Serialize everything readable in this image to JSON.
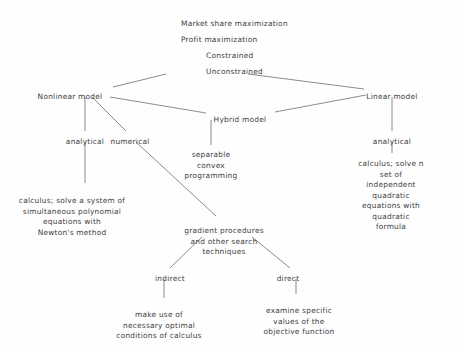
{
  "diagram": {
    "type": "hierarchy-tree",
    "background_color": "#fefefe",
    "text_color": "#3d3d3d",
    "line_color": "#6e6e6e",
    "nodes": [
      {
        "id": "market-share-maximization",
        "label": "Market share maximization",
        "x": 181,
        "y": 19,
        "align": "left"
      },
      {
        "id": "profit-maximization",
        "label": "Profit maximization",
        "x": 181,
        "y": 35,
        "align": "left"
      },
      {
        "id": "constrained",
        "label": "Constrained",
        "x": 206,
        "y": 51,
        "align": "left"
      },
      {
        "id": "unconstrained",
        "label": "Unconstrained",
        "x": 206,
        "y": 67,
        "align": "left"
      },
      {
        "id": "nonlinear-model",
        "label": "Nonlinear model",
        "x": 70,
        "y": 92,
        "align": "center"
      },
      {
        "id": "hybrid-model",
        "label": "Hybrid model",
        "x": 240,
        "y": 115,
        "align": "center"
      },
      {
        "id": "linear-model",
        "label": "Linear model",
        "x": 392,
        "y": 92,
        "align": "center"
      },
      {
        "id": "nonlinear-analytical",
        "label": "analytical",
        "x": 85,
        "y": 137,
        "align": "center"
      },
      {
        "id": "nonlinear-numerical",
        "label": "numerical",
        "x": 130,
        "y": 137,
        "align": "center"
      },
      {
        "id": "separable-convex-programming",
        "label": "separable\nconvex\nprogramming",
        "x": 211,
        "y": 150,
        "align": "center"
      },
      {
        "id": "linear-analytical",
        "label": "analytical",
        "x": 392,
        "y": 137,
        "align": "center"
      },
      {
        "id": "newton-method-leaf",
        "label": "calculus; solve a system of\nsimultaneous polynomial\nequations with\nNewton's method",
        "x": 72,
        "y": 196,
        "align": "center"
      },
      {
        "id": "quadratic-formula-leaf",
        "label": "calculus; solve n set of\nindependent quadratic\nequations with\nquadratic formula",
        "x": 391,
        "y": 159,
        "align": "center"
      },
      {
        "id": "gradient-procedures",
        "label": "gradient procedures\nand other search\ntechniques",
        "x": 224,
        "y": 226,
        "align": "center"
      },
      {
        "id": "indirect",
        "label": "indirect",
        "x": 170,
        "y": 274,
        "align": "center"
      },
      {
        "id": "direct",
        "label": "direct",
        "x": 288,
        "y": 274,
        "align": "center"
      },
      {
        "id": "necessary-optimal-conditions-leaf",
        "label": "make use of\nnecessary optimal\nconditions of calculus",
        "x": 159,
        "y": 310,
        "align": "center"
      },
      {
        "id": "objective-function-values-leaf",
        "label": "examine specific\nvalues of the\nobjective function",
        "x": 299,
        "y": 306,
        "align": "center"
      }
    ],
    "edges": [
      {
        "id": "unconstrained-to-nonlinear",
        "from": "unconstrained",
        "to": "nonlinear-model",
        "points": "166,74 113,87"
      },
      {
        "id": "unconstrained-to-linear",
        "from": "unconstrained",
        "to": "linear-model",
        "points": "248,74 364,89"
      },
      {
        "id": "nonlinear-to-hybrid",
        "from": "nonlinear-model",
        "to": "hybrid-model",
        "points": "110,97 206,113"
      },
      {
        "id": "hybrid-to-linear",
        "from": "hybrid-model",
        "to": "linear-model",
        "points": "275,112 366,95"
      },
      {
        "id": "nonlinear-to-analytical",
        "from": "nonlinear-model",
        "to": "nonlinear-analytical",
        "points": "85,97 85,131"
      },
      {
        "id": "nonlinear-to-numerical",
        "from": "nonlinear-model",
        "to": "nonlinear-numerical",
        "points": "92,97 126,131"
      },
      {
        "id": "analytical-to-newton",
        "from": "nonlinear-analytical",
        "to": "newton-method-leaf",
        "points": "85,142 85,183"
      },
      {
        "id": "numerical-to-gradient",
        "from": "nonlinear-numerical",
        "to": "gradient-procedures",
        "points": "136,142 216,216"
      },
      {
        "id": "hybrid-to-separable",
        "from": "hybrid-model",
        "to": "separable-convex-programming",
        "points": "211,120 211,145"
      },
      {
        "id": "linear-to-analytical",
        "from": "linear-model",
        "to": "linear-analytical",
        "points": "392,97 392,131"
      },
      {
        "id": "linear-analytical-to-quadratic",
        "from": "linear-analytical",
        "to": "quadratic-formula-leaf",
        "points": "392,142 392,153"
      },
      {
        "id": "gradient-to-indirect",
        "from": "gradient-procedures",
        "to": "indirect",
        "points": "202,237 170,268"
      },
      {
        "id": "gradient-to-direct",
        "from": "gradient-procedures",
        "to": "direct",
        "points": "252,237 290,268"
      },
      {
        "id": "indirect-to-conditions",
        "from": "indirect",
        "to": "necessary-optimal-conditions-leaf",
        "points": "164,279 164,298"
      },
      {
        "id": "direct-to-objective",
        "from": "direct",
        "to": "objective-function-values-leaf",
        "points": "296,279 296,294"
      }
    ]
  }
}
